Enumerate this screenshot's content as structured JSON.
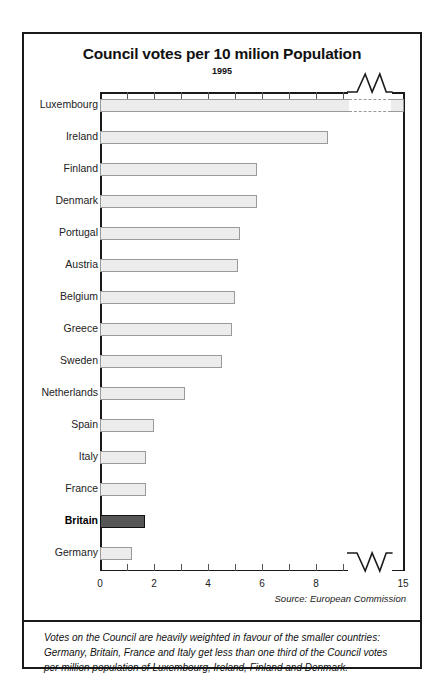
{
  "chart_data": {
    "type": "bar",
    "orientation": "horizontal",
    "title": "Council votes per 10 milion Population",
    "subtitle": "1995",
    "xlabel": "",
    "ylabel": "",
    "xlim": [
      0,
      15
    ],
    "axis_break": {
      "present": true,
      "from": 9.2,
      "to": 14.2
    },
    "grid": false,
    "legend": null,
    "tick_labels": [
      "0",
      "2",
      "4",
      "6",
      "8",
      "15"
    ],
    "tick_values": [
      0,
      2,
      4,
      6,
      8,
      15
    ],
    "highlight_category": "Britain",
    "categories": [
      "Luxembourg",
      "Ireland",
      "Finland",
      "Denmark",
      "Portugal",
      "Austria",
      "Belgium",
      "Greece",
      "Sweden",
      "Netherlands",
      "Spain",
      "Italy",
      "France",
      "Britain",
      "Germany"
    ],
    "values": [
      15.0,
      8.45,
      5.8,
      5.8,
      5.2,
      5.1,
      5.0,
      4.9,
      4.5,
      3.15,
      2.0,
      1.7,
      1.7,
      1.65,
      1.2
    ],
    "series": [
      {
        "name": "Council votes per 10 million population",
        "values": [
          15.0,
          8.45,
          5.8,
          5.8,
          5.2,
          5.1,
          5.0,
          4.9,
          4.5,
          3.15,
          2.0,
          1.7,
          1.7,
          1.65,
          1.2
        ]
      }
    ],
    "source": "Source: European Commission",
    "annotation": "Votes on the Council are heavily weighted in favour of the smaller countries: Germany, Britain, France and Italy get less than one third of the Council votes per million population of Luxembourg, Ireland, Finland and Denmark.",
    "colors": {
      "bar_fill": "#ececec",
      "bar_border": "#9a9a9a",
      "highlight_fill": "#565656",
      "highlight_border": "#111111",
      "axis": "#1a1a1a",
      "text": "#111111"
    }
  }
}
